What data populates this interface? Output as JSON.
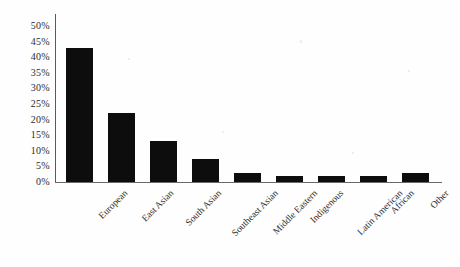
{
  "chart_data": {
    "type": "bar",
    "title": "",
    "xlabel": "",
    "ylabel": "",
    "categories": [
      "European",
      "East Asian",
      "South Asian",
      "Southeast Asian",
      "Middle Eastern",
      "Indigenous",
      "Latin American",
      "African",
      "Other"
    ],
    "values": [
      43,
      22,
      13,
      7.5,
      3,
      2,
      2,
      2,
      3
    ],
    "value_unit": "%",
    "ylim": [
      0,
      50
    ],
    "ytick_values": [
      0,
      5,
      10,
      15,
      20,
      25,
      30,
      35,
      40,
      45,
      50
    ],
    "ytick_labels": [
      "0%",
      "5%",
      "10%",
      "15%",
      "20%",
      "25%",
      "30%",
      "35%",
      "40%",
      "45%",
      "50%"
    ],
    "grid": false,
    "legend": false,
    "legend_position": "none",
    "bar_color": "#0d0d0d",
    "axis_color": "#5a5a5a",
    "background_color": "#fefefe"
  }
}
